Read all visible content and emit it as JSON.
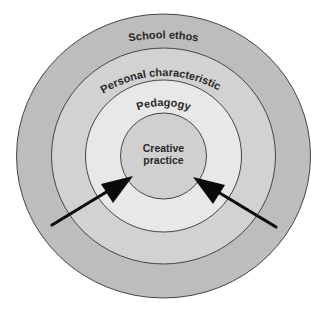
{
  "diagram": {
    "type": "concentric-circles",
    "center": {
      "x": 163.5,
      "y": 156
    },
    "rings": [
      {
        "id": "outer",
        "label": "School ethos",
        "rx": 147,
        "ry": 142,
        "fill": "#bdbdbd"
      },
      {
        "id": "second",
        "label": "Personal characteristics",
        "rx": 112,
        "ry": 108,
        "fill": "#d2d2d2"
      },
      {
        "id": "third",
        "label": "Pedagogy",
        "rx": 78,
        "ry": 76,
        "fill": "#e8e8e8"
      },
      {
        "id": "inner",
        "label_line1": "Creative",
        "label_line2": "practice",
        "rx": 43,
        "ry": 43,
        "fill": "#d0d0d0"
      }
    ],
    "stroke_color": "#454545",
    "arrow_color": "#0a0a0a",
    "arrows": [
      {
        "id": "left-arrow",
        "from": [
          52,
          225
        ],
        "to": [
          133,
          176
        ]
      },
      {
        "id": "right-arrow",
        "from": [
          276,
          227
        ],
        "to": [
          193,
          177
        ]
      }
    ]
  },
  "labels": {
    "school_ethos": "School ethos",
    "personal_characteristics": "Personal characteristics",
    "pedagogy": "Pedagogy",
    "creative": "Creative",
    "practice": "practice"
  }
}
